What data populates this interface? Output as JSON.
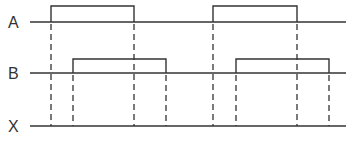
{
  "diagram": {
    "type": "timing-diagram",
    "signals": [
      {
        "name": "A",
        "baseline_y": 22,
        "high_y": 6,
        "line_x": [
          30,
          346
        ],
        "pulses": [
          [
            51,
            134
          ],
          [
            213,
            297
          ]
        ]
      },
      {
        "name": "B",
        "baseline_y": 73,
        "high_y": 59,
        "line_x": [
          30,
          346
        ],
        "pulses": [
          [
            73,
            166
          ],
          [
            236,
            329
          ]
        ]
      },
      {
        "name": "X",
        "baseline_y": 126,
        "high_y": null,
        "line_x": [
          30,
          346
        ],
        "pulses": []
      }
    ],
    "edge_markers_x": [
      51,
      73,
      134,
      166,
      213,
      236,
      297,
      329
    ],
    "colors": {
      "stroke": "#333333",
      "background": "#ffffff"
    }
  }
}
